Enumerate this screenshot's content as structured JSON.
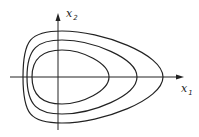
{
  "diagram": {
    "type": "phase-portrait",
    "axes": {
      "x": {
        "label": "x",
        "subscript": "1"
      },
      "y": {
        "label": "x",
        "subscript": "2"
      }
    },
    "curves": [
      {
        "name": "inner",
        "left": 32,
        "right": 109,
        "top": 50,
        "bottom": 104
      },
      {
        "name": "middle",
        "left": 27,
        "right": 137,
        "top": 40,
        "bottom": 114
      },
      {
        "name": "outer",
        "left": 23,
        "right": 163,
        "top": 31,
        "bottom": 123
      }
    ],
    "colors": {
      "stroke": "#222222",
      "background": "#ffffff"
    }
  }
}
